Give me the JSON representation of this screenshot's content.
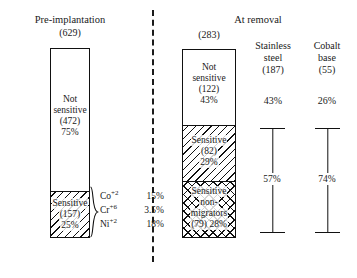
{
  "figure": {
    "type": "stacked-bar-diagram",
    "groups": [
      {
        "id": "pre-implantation",
        "title": "Pre-implantation",
        "total": "(629)",
        "segments": [
          {
            "id": "not-sensitive",
            "label": "Not\nsensitive\n(472)\n75%",
            "name": "Not sensitive",
            "count": "(472)",
            "percent": "75%",
            "fill": "plain",
            "share": 75
          },
          {
            "id": "sensitive",
            "label": "Sensitive\n(157)\n25%",
            "name": "Sensitive",
            "count": "(157)",
            "percent": "25%",
            "fill": "diagonal",
            "share": 25
          }
        ]
      },
      {
        "id": "at-removal",
        "title": "At removal",
        "total": "(283)",
        "segments": [
          {
            "id": "not-sensitive",
            "label": "Not\nsensitive\n(122)\n43%",
            "name": "Not sensitive",
            "count": "(122)",
            "percent": "43%",
            "fill": "plain",
            "share": 43
          },
          {
            "id": "sensitive",
            "label": "Sensitive\n(82)\n29%",
            "name": "Sensitive",
            "count": "(82)",
            "percent": "29%",
            "fill": "diagonal",
            "share": 29
          },
          {
            "id": "sensitive-non-migrators",
            "label": "Sensitive\nnon-\nmigrators\n(79) 28%",
            "name": "Sensitive non-migrators",
            "count": "(79)",
            "percent": "28%",
            "fill": "cross",
            "share": 28
          }
        ]
      }
    ],
    "ions": {
      "rows": [
        {
          "symbol": "Co",
          "charge": "+2",
          "value": "15%"
        },
        {
          "symbol": "Cr",
          "charge": "+6",
          "value": "3.5%"
        },
        {
          "symbol": "Ni",
          "charge": "+2",
          "value": "18%"
        }
      ]
    },
    "materials": [
      {
        "id": "stainless-steel",
        "title_line1": "Stainless",
        "title_line2": "steel",
        "total": "(187)",
        "top_value": "43%",
        "range_value": "57%"
      },
      {
        "id": "cobalt-base",
        "title_line1": "Cobalt",
        "title_line2": "base",
        "total": "(55)",
        "top_value": "26%",
        "range_value": "74%"
      }
    ]
  },
  "chart_data": {
    "type": "bar",
    "title": "",
    "xlabel": "",
    "ylabel": "",
    "categories": [
      "Pre-implantation (629)",
      "At removal (283)"
    ],
    "series": [
      {
        "name": "Not sensitive",
        "values": [
          75,
          43
        ],
        "counts": [
          472,
          122
        ],
        "fill": "plain"
      },
      {
        "name": "Sensitive",
        "values": [
          25,
          29
        ],
        "counts": [
          157,
          82
        ],
        "fill": "diagonal"
      },
      {
        "name": "Sensitive non-migrators",
        "values": [
          0,
          28
        ],
        "counts": [
          0,
          79
        ],
        "fill": "cross"
      }
    ],
    "annotations": [
      {
        "text": "Co+2",
        "value": "15%"
      },
      {
        "text": "Cr+6",
        "value": "3.5%"
      },
      {
        "text": "Ni+2",
        "value": "18%"
      },
      {
        "text": "Stainless steel (187) 43% / 57%"
      },
      {
        "text": "Cobalt base (55) 26% / 74%"
      }
    ],
    "ylim": [
      0,
      100
    ],
    "grid": false,
    "legend": "none"
  }
}
